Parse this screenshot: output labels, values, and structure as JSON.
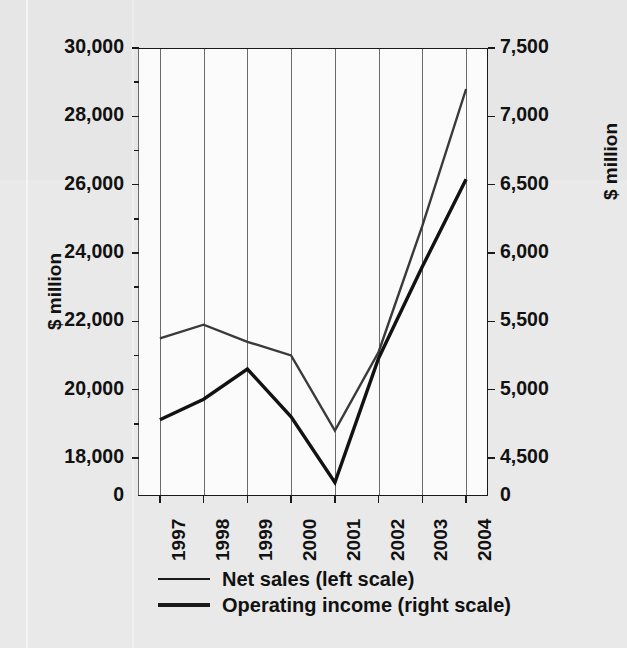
{
  "chart_data": {
    "type": "line",
    "title": "",
    "subtitle": "",
    "xlabel": "",
    "categories": [
      "1997",
      "1998",
      "1999",
      "2000",
      "2001",
      "2002",
      "2003",
      "2004"
    ],
    "grid": "vertical-only",
    "legend_position": "bottom",
    "series": [
      {
        "name": "Net sales (left scale)",
        "axis": "left",
        "unit": "$ million",
        "color": "#3a3a3a",
        "values": [
          21500,
          21900,
          21400,
          21000,
          18800,
          21100,
          24800,
          28800
        ]
      },
      {
        "name": "Operating income (right scale)",
        "axis": "right",
        "unit": "$ million",
        "color": "#141414",
        "values": [
          4780,
          4930,
          5150,
          4800,
          4320,
          5230,
          5900,
          6540
        ]
      }
    ],
    "left_axis": {
      "label": "$ million",
      "ylim": [
        18000,
        30000
      ],
      "broken_at_zero": true,
      "ticks": [
        {
          "value": 0,
          "label": "0"
        },
        {
          "value": 18000,
          "label": "18,000"
        },
        {
          "value": 20000,
          "label": "20,000"
        },
        {
          "value": 22000,
          "label": "22,000"
        },
        {
          "value": 24000,
          "label": "24,000"
        },
        {
          "value": 26000,
          "label": "26,000"
        },
        {
          "value": 28000,
          "label": "28,000"
        },
        {
          "value": 30000,
          "label": "30,000"
        }
      ],
      "minor_ticks": [
        19000,
        21000,
        23000,
        25000,
        27000,
        29000
      ]
    },
    "right_axis": {
      "label": "$ million",
      "ylim": [
        4500,
        7500
      ],
      "broken_at_zero": true,
      "ticks": [
        {
          "value": 0,
          "label": "0"
        },
        {
          "value": 4500,
          "label": "4,500"
        },
        {
          "value": 5000,
          "label": "5,000"
        },
        {
          "value": 5500,
          "label": "5,500"
        },
        {
          "value": 6000,
          "label": "6,000"
        },
        {
          "value": 6500,
          "label": "6,500"
        },
        {
          "value": 7000,
          "label": "7,000"
        },
        {
          "value": 7500,
          "label": "7,500"
        }
      ],
      "minor_ticks": []
    }
  },
  "legend": {
    "items": [
      {
        "label": "Net sales (left scale)",
        "weight": "thin"
      },
      {
        "label": "Operating income (right scale)",
        "weight": "thick"
      }
    ]
  }
}
